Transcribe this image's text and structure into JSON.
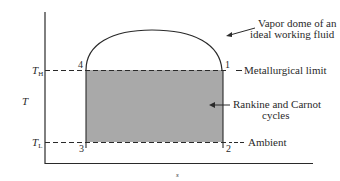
{
  "diagram": {
    "type": "T-s diagram",
    "y_axis_label": "T",
    "x_axis_label": "s",
    "levels": {
      "high": {
        "symbol": "T",
        "subscript": "H",
        "annotation": "Metallurgical limit"
      },
      "low": {
        "symbol": "T",
        "subscript": "L",
        "annotation": "Ambient"
      }
    },
    "points": [
      {
        "id": "1",
        "label": "1"
      },
      {
        "id": "2",
        "label": "2"
      },
      {
        "id": "3",
        "label": "3"
      },
      {
        "id": "4",
        "label": "4"
      }
    ],
    "dome_annotation_line1": "Vapor dome of an",
    "dome_annotation_line2": "ideal working fluid",
    "cycle_annotation_line1": "Rankine and Carnot",
    "cycle_annotation_line2": "cycles",
    "colors": {
      "line": "#2a2a2a",
      "fill": "#a9a9a9",
      "background": "#ffffff"
    }
  }
}
